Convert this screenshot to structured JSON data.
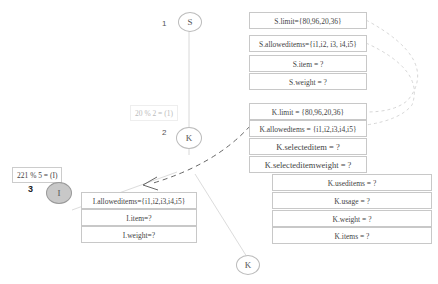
{
  "nodes": {
    "s": {
      "label": "S",
      "level": "1"
    },
    "k": {
      "label": "K",
      "level": "2"
    },
    "i": {
      "label": "I",
      "level": "3"
    },
    "k2": {
      "label": "K"
    }
  },
  "edge_labels": {
    "sk": "20 % 2 = (1)",
    "ki": "221 % 5 = (I)"
  },
  "s_box": [
    "S.limit={80,96,20,36}",
    "S.alloweditems={i1,i2, i3, i4,i5}",
    "S.item = ?",
    "S.weight = ?"
  ],
  "k_box": [
    "K.limit = {80,96,20,36}",
    "K.allowedtems = {i1,i2,i3,i4,i5}",
    "K.selecteditem = ?",
    "K.selecteditemweight = ?",
    "K.useditems = ?",
    "K.usage = ?",
    "K.weight = ?",
    "K.items = ?"
  ],
  "i_box": [
    "I.alloweditems={i1,i2,i3,i4,i5}",
    "I.item=?",
    "I.weight=?"
  ]
}
